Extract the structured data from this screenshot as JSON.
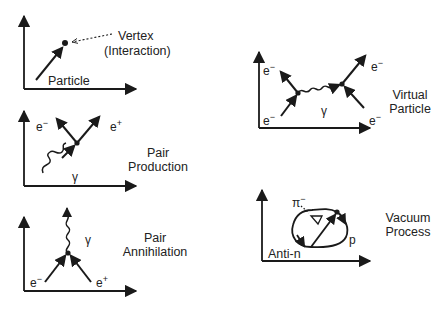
{
  "panels": [
    {
      "id": "particle",
      "labels": {
        "vertex": "Vertex",
        "interaction": "(Interaction)",
        "particle": "Particle"
      }
    },
    {
      "id": "pair-production",
      "title": [
        "Pair",
        "Production"
      ],
      "labels": {
        "electron": "e",
        "electron_sup": "−",
        "positron": "e",
        "positron_sup": "+",
        "photon": "γ"
      }
    },
    {
      "id": "pair-annihilation",
      "title": [
        "Pair",
        "Annihilation"
      ],
      "labels": {
        "electron": "e",
        "electron_sup": "−",
        "positron": "e",
        "positron_sup": "+",
        "photon": "γ"
      }
    },
    {
      "id": "virtual-particle",
      "title": [
        "Virtual",
        "Particle"
      ],
      "labels": {
        "e": "e",
        "e_sup": "−",
        "photon": "γ"
      }
    },
    {
      "id": "vacuum-process",
      "title": [
        "Vacuum",
        "Process"
      ],
      "labels": {
        "pion": "π",
        "pion_sup": "−",
        "proton": "p",
        "antineutron": "Anti-n"
      }
    }
  ],
  "colors": {
    "ink": "#1a1a1a",
    "background": "#ffffff"
  }
}
